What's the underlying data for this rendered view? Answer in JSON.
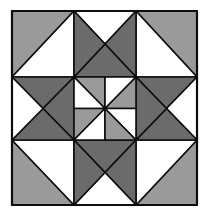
{
  "diagram": {
    "type": "quilt-block",
    "grid": "3x3",
    "colors": {
      "white": "#ffffff",
      "light_gray": "#9a9a9a",
      "dark_gray": "#6b6b6b",
      "line": "#0d0d0d"
    },
    "cells": {
      "corner_top_left": {
        "kind": "half-square-triangle",
        "diagonal": "bl-tr",
        "upper": "light_gray",
        "lower": "white"
      },
      "corner_top_right": {
        "kind": "half-square-triangle",
        "diagonal": "tl-br",
        "upper": "light_gray",
        "lower": "white"
      },
      "corner_bottom_left": {
        "kind": "half-square-triangle",
        "diagonal": "tl-br",
        "upper": "white",
        "lower": "light_gray"
      },
      "corner_bottom_right": {
        "kind": "half-square-triangle",
        "diagonal": "bl-tr",
        "upper": "white",
        "lower": "light_gray"
      },
      "edge_top": {
        "kind": "quarter-square-triangle",
        "top": "white",
        "right": "dark_gray",
        "bottom": "dark_gray",
        "left": "dark_gray"
      },
      "edge_right": {
        "kind": "quarter-square-triangle",
        "top": "dark_gray",
        "right": "white",
        "bottom": "dark_gray",
        "left": "dark_gray"
      },
      "edge_bottom": {
        "kind": "quarter-square-triangle",
        "top": "dark_gray",
        "right": "dark_gray",
        "bottom": "white",
        "left": "dark_gray"
      },
      "edge_left": {
        "kind": "quarter-square-triangle",
        "top": "dark_gray",
        "right": "dark_gray",
        "bottom": "dark_gray",
        "left": "white"
      },
      "center": {
        "kind": "pinwheel",
        "colors": [
          "light_gray",
          "white"
        ]
      }
    }
  }
}
